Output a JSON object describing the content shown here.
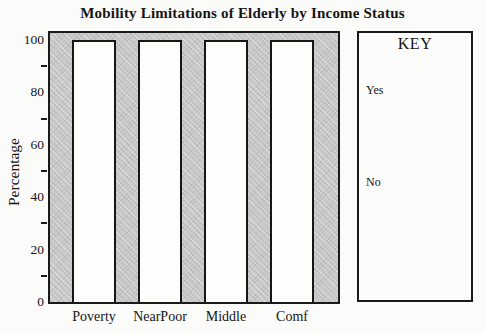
{
  "chart_data": {
    "type": "bar",
    "title": "Mobility Limitations of Elderly by Income Status",
    "categories": [
      "Poverty",
      "NearPoor",
      "Middle",
      "Comf"
    ],
    "values": [
      100,
      100,
      100,
      100
    ],
    "xlabel": "",
    "ylabel": "Percentage",
    "ylim": [
      0,
      100
    ],
    "y_major_ticks": [
      0,
      20,
      40,
      60,
      80,
      100
    ],
    "y_minor_ticks": [
      10,
      30,
      50,
      70,
      90
    ],
    "grid": false,
    "legend_position": "right",
    "colors": {
      "plot_background": "#c9c9c9",
      "bar_fill": "#fdfdfc",
      "line": "#1a1a1a"
    }
  },
  "key": {
    "title": "KEY",
    "entries": [
      "Yes",
      "No"
    ]
  }
}
